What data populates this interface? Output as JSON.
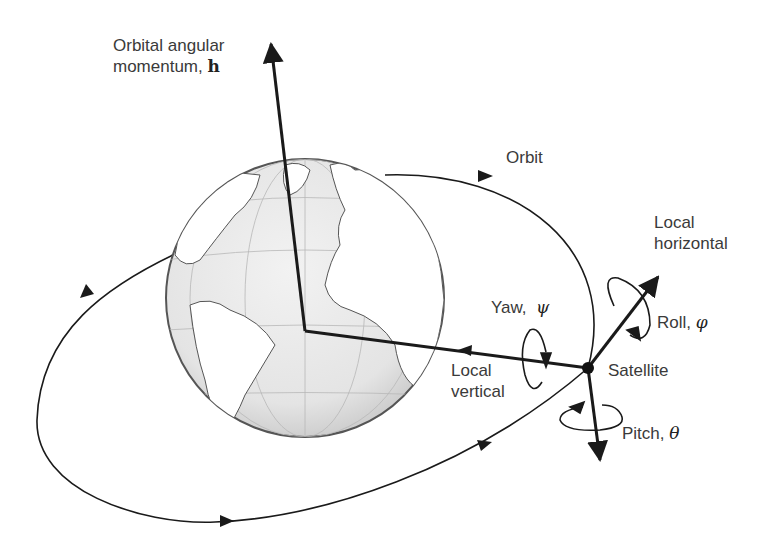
{
  "diagram": {
    "labels": {
      "h_line1": "Orbital angular",
      "h_line2": "momentum,",
      "h_symbol": "h",
      "orbit": "Orbit",
      "local_horizontal_1": "Local",
      "local_horizontal_2": "horizontal",
      "roll": "Roll,",
      "roll_symbol": "φ",
      "yaw": "Yaw,",
      "yaw_symbol": "ψ",
      "satellite": "Satellite",
      "local_vertical_1": "Local",
      "local_vertical_2": "vertical",
      "pitch": "Pitch,",
      "pitch_symbol": "θ"
    },
    "colors": {
      "line": "#1a1a1a",
      "globe_fill": "#e6e6e6",
      "globe_land": "#ffffff",
      "text": "#3a3a3a"
    }
  }
}
